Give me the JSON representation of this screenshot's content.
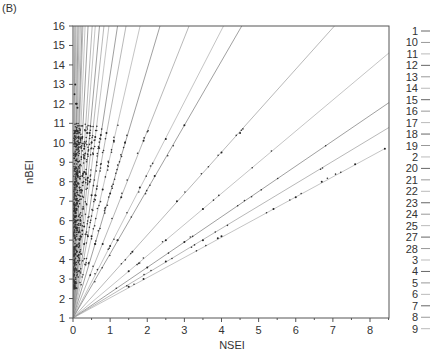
{
  "panel_label": "(B)",
  "chart_data": {
    "type": "scatter",
    "title": "",
    "xlabel": "NSEI",
    "ylabel": "nBEI",
    "xlim": [
      0,
      8.5
    ],
    "ylim": [
      1,
      16
    ],
    "xticks": [
      0,
      1,
      2,
      3,
      4,
      5,
      6,
      7,
      8
    ],
    "yticks": [
      1,
      2,
      3,
      4,
      5,
      6,
      7,
      8,
      9,
      10,
      11,
      12,
      13,
      14,
      15,
      16
    ],
    "grid": false,
    "legend_position": "right",
    "fit_lines_through": [
      0,
      1
    ],
    "series": [
      {
        "name": "1",
        "slope": 300.0,
        "points": [
          [
            0.02,
            6.5
          ],
          [
            0.03,
            9.2
          ],
          [
            0.04,
            12.5
          ]
        ]
      },
      {
        "name": "10",
        "slope": 200.0,
        "points": [
          [
            0.03,
            6.8
          ],
          [
            0.05,
            10.5
          ],
          [
            0.06,
            13.0
          ]
        ]
      },
      {
        "name": "11",
        "slope": 140.0,
        "points": [
          [
            0.04,
            6.6
          ],
          [
            0.06,
            9.4
          ],
          [
            0.08,
            12.0
          ]
        ]
      },
      {
        "name": "12",
        "slope": 110.0,
        "points": [
          [
            0.05,
            6.5
          ],
          [
            0.08,
            9.8
          ],
          [
            0.1,
            12.0
          ]
        ]
      },
      {
        "name": "13",
        "slope": 90.0,
        "points": [
          [
            0.06,
            6.4
          ],
          [
            0.09,
            9.1
          ],
          [
            0.12,
            11.8
          ]
        ]
      },
      {
        "name": "14",
        "slope": 74.0,
        "points": [
          [
            0.07,
            6.2
          ],
          [
            0.1,
            8.4
          ],
          [
            0.13,
            10.6
          ]
        ]
      },
      {
        "name": "15",
        "slope": 62.0,
        "points": [
          [
            0.08,
            6.0
          ],
          [
            0.12,
            8.4
          ],
          [
            0.15,
            10.3
          ]
        ]
      },
      {
        "name": "16",
        "slope": 56.0,
        "points": [
          [
            0.1,
            6.6
          ],
          [
            0.13,
            8.3
          ],
          [
            0.16,
            10.0
          ]
        ]
      },
      {
        "name": "17",
        "slope": 46.0,
        "points": [
          [
            0.1,
            5.6
          ],
          [
            0.15,
            7.9
          ],
          [
            0.2,
            10.2
          ]
        ]
      },
      {
        "name": "18",
        "slope": 37.0,
        "points": [
          [
            0.1,
            4.7
          ],
          [
            0.18,
            7.7
          ],
          [
            0.25,
            10.3
          ]
        ]
      },
      {
        "name": "19",
        "slope": 29.0,
        "points": [
          [
            0.15,
            5.4
          ],
          [
            0.25,
            8.3
          ],
          [
            0.3,
            9.7
          ]
        ]
      },
      {
        "name": "2",
        "slope": 25.0,
        "points": [
          [
            0.2,
            6.0
          ],
          [
            0.3,
            8.5
          ],
          [
            0.38,
            10.5
          ]
        ]
      },
      {
        "name": "20",
        "slope": 21.0,
        "points": [
          [
            0.2,
            5.2
          ],
          [
            0.35,
            8.4
          ],
          [
            0.45,
            10.5
          ]
        ]
      },
      {
        "name": "21",
        "slope": 18.0,
        "points": [
          [
            0.25,
            5.5
          ],
          [
            0.4,
            8.2
          ],
          [
            0.5,
            10.0
          ]
        ]
      },
      {
        "name": "22",
        "slope": 15.5,
        "points": [
          [
            0.3,
            5.7
          ],
          [
            0.45,
            8.0
          ],
          [
            0.6,
            10.3
          ]
        ]
      },
      {
        "name": "23",
        "slope": 12.5,
        "points": [
          [
            0.3,
            4.8
          ],
          [
            0.5,
            7.3
          ],
          [
            0.75,
            10.4
          ]
        ]
      },
      {
        "name": "24",
        "slope": 10.5,
        "points": [
          [
            0.4,
            5.2
          ],
          [
            0.6,
            7.3
          ],
          [
            0.9,
            10.5
          ]
        ]
      },
      {
        "name": "25",
        "slope": 8.3,
        "points": [
          [
            0.5,
            5.2
          ],
          [
            0.8,
            7.6
          ],
          [
            1.1,
            10.1
          ]
        ]
      },
      {
        "name": "27",
        "slope": 6.4,
        "points": [
          [
            0.6,
            4.8
          ],
          [
            1.0,
            7.4
          ],
          [
            1.4,
            10.0
          ]
        ]
      },
      {
        "name": "28",
        "slope": 4.8,
        "points": [
          [
            0.8,
            4.8
          ],
          [
            1.3,
            7.2
          ],
          [
            1.9,
            10.1
          ]
        ]
      },
      {
        "name": "3",
        "slope": 3.7,
        "points": [
          [
            1.0,
            4.7
          ],
          [
            1.8,
            7.7
          ],
          [
            2.5,
            10.2
          ]
        ]
      },
      {
        "name": "4",
        "slope": 3.3,
        "points": [
          [
            1.2,
            5.0
          ],
          [
            2.2,
            8.3
          ],
          [
            3.0,
            10.9
          ]
        ]
      },
      {
        "name": "5",
        "slope": 2.13,
        "points": [
          [
            1.6,
            4.4
          ],
          [
            2.8,
            7.0
          ],
          [
            4.0,
            9.5
          ],
          [
            4.5,
            10.5
          ]
        ]
      },
      {
        "name": "6",
        "slope": 1.6,
        "points": [
          [
            1.5,
            3.4
          ],
          [
            2.5,
            5.0
          ],
          [
            3.5,
            6.6
          ]
        ]
      },
      {
        "name": "7",
        "slope": 1.3,
        "points": [
          [
            2.0,
            3.6
          ],
          [
            3.0,
            4.9
          ]
        ]
      },
      {
        "name": "8",
        "slope": 1.15,
        "points": [
          [
            2.5,
            3.9
          ],
          [
            3.5,
            5.0
          ]
        ]
      },
      {
        "name": "9",
        "slope": 1.04,
        "points": [
          [
            1.5,
            2.6
          ],
          [
            1.9,
            3.0
          ],
          [
            3.9,
            5.1
          ],
          [
            4.0,
            5.2
          ],
          [
            5.4,
            6.6
          ],
          [
            6.0,
            7.2
          ],
          [
            6.7,
            8.0
          ],
          [
            7.6,
            8.9
          ],
          [
            8.4,
            9.7
          ]
        ]
      }
    ]
  },
  "legend_entries": [
    "1",
    "10",
    "11",
    "12",
    "13",
    "14",
    "15",
    "16",
    "17",
    "18",
    "19",
    "2",
    "20",
    "21",
    "22",
    "23",
    "24",
    "25",
    "27",
    "28",
    "3",
    "4",
    "5",
    "6",
    "7",
    "8",
    "9"
  ]
}
